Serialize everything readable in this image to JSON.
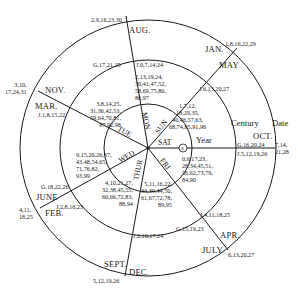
{
  "headers": {
    "year": "Year",
    "century": "Century",
    "date": "Date"
  },
  "weekdays": [
    "SUN",
    "MON",
    "TUE",
    "WED",
    "THUR",
    "FRI",
    "SAT"
  ],
  "marker": "x",
  "year_sectors": [
    {
      "weekday": "SUN",
      "years": "1,7,12,\n18,29,35,\n40,46,57,63,\n68,74,85,91,96"
    },
    {
      "weekday": "MON",
      "years": "2,13,19,24,\n30,41,47,52,\n58,69,75,80,\n86,97"
    },
    {
      "weekday": "TUE",
      "years": "3,8,14,25,\n31,36,42,53,\n59,64,70,81,\n87,92,98"
    },
    {
      "weekday": "WED",
      "years": "9,15,20,26,37,\n43,48,54,65,\n71,76,82,\n93,99"
    },
    {
      "weekday": "THUR",
      "years": "4,10,21,27,\n32,38,45,55,\n60,66,72,83,\n88,94"
    },
    {
      "weekday": "FRI",
      "years": "5,11,16,22,\n33,39,44,50,\n61,67,72,78,\n89,95"
    },
    {
      "weekday": "SAT",
      "years": "0,6,17,23,\n28,34,45,51,\n56,62,73,79,\n84,90"
    }
  ],
  "century_sectors": [
    {
      "outer": "G.16,20,24",
      "inner": "J.5,12,19,26"
    },
    {
      "outer": "",
      "inner": "J.6,13,20,27"
    },
    {
      "outer": "G.17,21,25",
      "inner": "J.0,7,14,24"
    },
    {
      "outer": "",
      "inner": "J.1,8,15,22"
    },
    {
      "outer": "G.18,22,26",
      "inner": "J.2,8,16,23"
    },
    {
      "outer": "",
      "inner": "J.2,10,17,24"
    },
    {
      "outer": "G.15,19,23",
      "inner": "J.4,11,18,25"
    }
  ],
  "month_sectors": [
    {
      "months": "OCT.",
      "dates": "7,14,\n21,28"
    },
    {
      "months": [
        "JAN.",
        "MAY"
      ],
      "dates": "1,8,16,22,29"
    },
    {
      "months": [
        "AUG."
      ],
      "dates": "2,9,16,23,30"
    },
    {
      "months": [
        "NOV.",
        "MAR."
      ],
      "dates": "3,10,\n17,24,31"
    },
    {
      "months": [
        "JUNE",
        "FEB."
      ],
      "dates": "4,11,\n18,25"
    },
    {
      "months": [
        "SEPT.",
        "DEC."
      ],
      "dates": "5,12,19,26"
    },
    {
      "months": [
        "APR.",
        "JULY"
      ],
      "dates": "6,13,20,27"
    }
  ],
  "style": {
    "line_color": "#1a1a1a",
    "background": "#ffffff"
  }
}
